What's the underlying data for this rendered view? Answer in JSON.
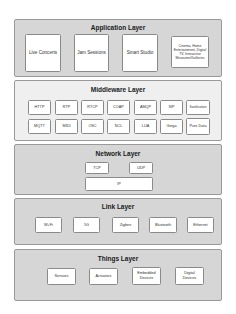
{
  "diagram": {
    "layers": [
      {
        "title": "Application Layer",
        "items": [
          "Live Concerts",
          "Jam Sessions",
          "Smart Studio",
          "Cinema, Home Entertainment, Digital TV, Interactive Museums/Galleries"
        ]
      },
      {
        "title": "Middleware Layer",
        "items": [
          "HTTP",
          "RTP",
          "RTCP",
          "COAP",
          "AMQP",
          "SIP",
          "Sonification",
          "MQTT",
          "MIDI",
          "OSC",
          "NCL",
          "LUA",
          "Ginga",
          "Pure Data"
        ]
      },
      {
        "title": "Network Layer",
        "items": [
          "TCP",
          "UDP",
          "IP"
        ]
      },
      {
        "title": "Link Layer",
        "items": [
          "Wi-Fi",
          "5G",
          "Zigbee",
          "Bluetooth",
          "Ethernet"
        ]
      },
      {
        "title": "Things Layer",
        "items": [
          "Sensors",
          "Actuators",
          "Embedded Devices",
          "Digital Devices"
        ]
      }
    ],
    "colors": {
      "layer_fill": "#d6d6d6",
      "middleware_fill": "#efefef",
      "box_fill": "#ffffff",
      "border": "#8a8a8a"
    }
  }
}
